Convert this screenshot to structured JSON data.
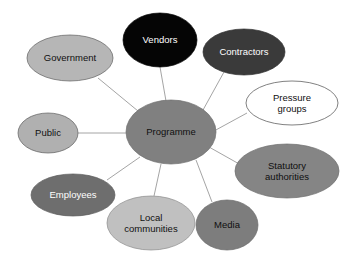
{
  "diagram": {
    "type": "stakeholder-map",
    "background": "#ffffff",
    "link_color": "#9a9a9a",
    "center": {
      "id": "programme",
      "label": "Programme",
      "lines": [
        "Programme"
      ],
      "cx": 171,
      "cy": 132,
      "rx": 45,
      "ry": 32,
      "fill": "#808080",
      "stroke": "#6f6f6f",
      "text_color": "#101010"
    },
    "nodes": [
      {
        "id": "government",
        "label": "Government",
        "lines": [
          "Government"
        ],
        "cx": 70,
        "cy": 58,
        "rx": 43,
        "ry": 23,
        "fill": "#b6b6b6",
        "stroke": "#5f5f5f",
        "text_color": "#101010"
      },
      {
        "id": "vendors",
        "label": "Vendors",
        "lines": [
          "Vendors"
        ],
        "cx": 160,
        "cy": 40,
        "rx": 37,
        "ry": 27,
        "fill": "#050505",
        "stroke": "#050505",
        "text_color": "#ffffff"
      },
      {
        "id": "contractors",
        "label": "Contractors",
        "lines": [
          "Contractors"
        ],
        "cx": 244,
        "cy": 52,
        "rx": 41,
        "ry": 23,
        "fill": "#3a3a3a",
        "stroke": "#303030",
        "text_color": "#ffffff"
      },
      {
        "id": "pressure-groups",
        "label": "Pressure groups",
        "lines": [
          "Pressure",
          "groups"
        ],
        "cx": 292,
        "cy": 103,
        "rx": 46,
        "ry": 22,
        "fill": "#ffffff",
        "stroke": "#4a4a4a",
        "text_color": "#101010"
      },
      {
        "id": "public",
        "label": "Public",
        "lines": [
          "Public"
        ],
        "cx": 48,
        "cy": 133,
        "rx": 30,
        "ry": 20,
        "fill": "#b0b0b0",
        "stroke": "#5f5f5f",
        "text_color": "#101010"
      },
      {
        "id": "statutory-authorities",
        "label": "Statutory authorities",
        "lines": [
          "Statutory",
          "authorities"
        ],
        "cx": 287,
        "cy": 171,
        "rx": 52,
        "ry": 27,
        "fill": "#858585",
        "stroke": "#6f6f6f",
        "text_color": "#0f0f0f"
      },
      {
        "id": "employees",
        "label": "Employees",
        "lines": [
          "Employees"
        ],
        "cx": 73,
        "cy": 195,
        "rx": 42,
        "ry": 21,
        "fill": "#6e6e6e",
        "stroke": "#5c5c5c",
        "text_color": "#ffffff"
      },
      {
        "id": "local-communities",
        "label": "Local communities",
        "lines": [
          "Local",
          "communities"
        ],
        "cx": 151,
        "cy": 223,
        "rx": 44,
        "ry": 27,
        "fill": "#c0c0c0",
        "stroke": "#8a8a8a",
        "text_color": "#101010"
      },
      {
        "id": "media",
        "label": "Media",
        "lines": [
          "Media"
        ],
        "cx": 227,
        "cy": 225,
        "rx": 31,
        "ry": 25,
        "fill": "#7d7d7d",
        "stroke": "#6a6a6a",
        "text_color": "#0f0f0f"
      }
    ],
    "links": [
      {
        "id": "link-programme-government",
        "from": "programme",
        "to": "government",
        "x1": 138,
        "y1": 111,
        "x2": 98,
        "y2": 78
      },
      {
        "id": "link-programme-vendors",
        "from": "programme",
        "to": "vendors",
        "x1": 166,
        "y1": 101,
        "x2": 160,
        "y2": 67
      },
      {
        "id": "link-programme-contractors",
        "from": "programme",
        "to": "contractors",
        "x1": 203,
        "y1": 110,
        "x2": 224,
        "y2": 72
      },
      {
        "id": "link-programme-pressure-groups",
        "from": "programme",
        "to": "pressure-groups",
        "x1": 214,
        "y1": 131,
        "x2": 247,
        "y2": 113
      },
      {
        "id": "link-programme-public",
        "from": "programme",
        "to": "public",
        "x1": 127,
        "y1": 133,
        "x2": 78,
        "y2": 133
      },
      {
        "id": "link-programme-statutory-authorities",
        "from": "programme",
        "to": "statutory-authorities",
        "x1": 209,
        "y1": 147,
        "x2": 241,
        "y2": 165
      },
      {
        "id": "link-programme-employees",
        "from": "programme",
        "to": "employees",
        "x1": 140,
        "y1": 157,
        "x2": 107,
        "y2": 180
      },
      {
        "id": "link-programme-local-communities",
        "from": "programme",
        "to": "local-communities",
        "x1": 161,
        "y1": 164,
        "x2": 154,
        "y2": 196
      },
      {
        "id": "link-programme-media",
        "from": "programme",
        "to": "media",
        "x1": 196,
        "y1": 160,
        "x2": 212,
        "y2": 202
      }
    ]
  }
}
